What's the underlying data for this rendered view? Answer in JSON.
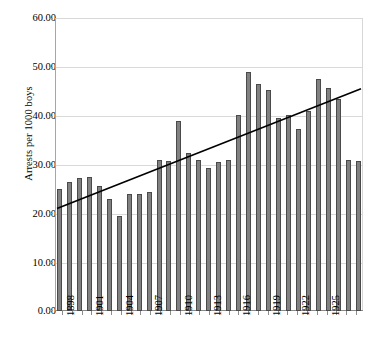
{
  "chart_data": {
    "type": "bar",
    "title": "",
    "xlabel": "",
    "ylabel": "Arrests per 1000 boys",
    "ylim": [
      0,
      60
    ],
    "ytick_labels": [
      "60.00",
      "50.00",
      "40.00",
      "30.00",
      "20.00",
      "10.00",
      "0.00"
    ],
    "ytick_values": [
      60,
      50,
      40,
      30,
      20,
      10,
      0
    ],
    "grid": true,
    "legend": "none",
    "categories": [
      "1898",
      "1899",
      "1900",
      "1901",
      "1902",
      "1903",
      "1904",
      "1905",
      "1906",
      "1907",
      "1908",
      "1909",
      "1910",
      "1911",
      "1912",
      "1913",
      "1914",
      "1915",
      "1916",
      "1917",
      "1918",
      "1919",
      "1920",
      "1921",
      "1922",
      "1923",
      "1924",
      "1925",
      "1926",
      "1927",
      "1928"
    ],
    "xtick_labels_shown": [
      "1898",
      "1901",
      "1904",
      "1907",
      "1910",
      "1913",
      "1916",
      "1919",
      "1922",
      "1925"
    ],
    "values": [
      25.0,
      26.5,
      27.3,
      27.5,
      25.5,
      23.0,
      19.5,
      24.0,
      24.0,
      24.3,
      31.0,
      30.8,
      39.0,
      32.3,
      31.0,
      29.2,
      30.6,
      30.9,
      40.2,
      49.0,
      46.5,
      45.2,
      39.6,
      40.2,
      37.2,
      41.0,
      47.5,
      45.6,
      43.5,
      31.0,
      30.8
    ],
    "series": [
      {
        "name": "Arrests per 1000 boys",
        "values": [
          25.0,
          26.5,
          27.3,
          27.5,
          25.5,
          23.0,
          19.5,
          24.0,
          24.0,
          24.3,
          31.0,
          30.8,
          39.0,
          32.3,
          31.0,
          29.2,
          30.6,
          30.9,
          40.2,
          49.0,
          46.5,
          45.2,
          39.6,
          40.2,
          37.2,
          41.0,
          47.5,
          45.6,
          43.5,
          31.0,
          30.8
        ]
      },
      {
        "name": "linear trend",
        "type": "line",
        "start_value": 21.0,
        "end_value": 45.5
      }
    ],
    "bar_fill_color": "#818181",
    "bar_edge_color": "#4a4a4a",
    "trend_line_color": "#000000",
    "grid_color": "#d9d9d9"
  }
}
